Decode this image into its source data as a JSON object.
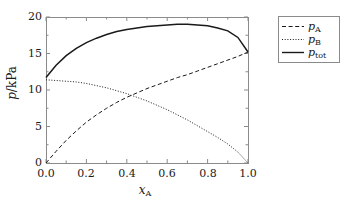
{
  "chart_data": {
    "type": "line",
    "title": "",
    "xlabel": "x_A",
    "ylabel": "p/kPa",
    "xlim": [
      0.0,
      1.0
    ],
    "ylim": [
      0.0,
      20.0
    ],
    "grid": false,
    "legend_position": "right-outside",
    "x_ticks": [
      "0.0",
      "0.2",
      "0.4",
      "0.6",
      "0.8",
      "1.0"
    ],
    "x_tick_values": [
      0.0,
      0.2,
      0.4,
      0.6,
      0.8,
      1.0
    ],
    "y_ticks": [
      "0",
      "5",
      "10",
      "15",
      "20"
    ],
    "y_tick_values": [
      0,
      5,
      10,
      15,
      20
    ],
    "x": [
      0.0,
      0.05,
      0.1,
      0.15,
      0.2,
      0.25,
      0.3,
      0.35,
      0.4,
      0.45,
      0.5,
      0.55,
      0.6,
      0.65,
      0.7,
      0.75,
      0.8,
      0.85,
      0.9,
      0.95,
      1.0
    ],
    "series": [
      {
        "name": "p_A",
        "label": "pA",
        "style": "dashed",
        "color": "#1a1a1a",
        "values": [
          0.0,
          1.6,
          3.1,
          4.4,
          5.6,
          6.6,
          7.5,
          8.3,
          9.0,
          9.6,
          10.2,
          10.7,
          11.2,
          11.7,
          12.1,
          12.6,
          13.1,
          13.6,
          14.1,
          14.6,
          15.2
        ]
      },
      {
        "name": "p_B",
        "label": "pB",
        "style": "dotted",
        "color": "#1a1a1a",
        "values": [
          11.4,
          11.3,
          11.2,
          11.1,
          10.9,
          10.6,
          10.3,
          9.9,
          9.5,
          9.0,
          8.5,
          7.9,
          7.3,
          6.6,
          5.9,
          5.1,
          4.3,
          3.5,
          2.6,
          1.5,
          0.0
        ]
      },
      {
        "name": "p_tot",
        "label": "ptot",
        "style": "solid",
        "color": "#1a1a1a",
        "values": [
          11.7,
          13.4,
          14.7,
          15.7,
          16.5,
          17.1,
          17.6,
          18.0,
          18.3,
          18.5,
          18.7,
          18.8,
          18.9,
          19.0,
          19.0,
          18.9,
          18.8,
          18.5,
          18.1,
          17.2,
          15.2
        ]
      }
    ],
    "legend": [
      {
        "label_main": "p",
        "label_sub": "A",
        "style": "dashed"
      },
      {
        "label_main": "p",
        "label_sub": "B",
        "style": "dotted"
      },
      {
        "label_main": "p",
        "label_sub": "tot",
        "style": "solid"
      }
    ],
    "axis_titles": {
      "y_main": "p",
      "y_unit": "/kPa",
      "x_main": "x",
      "x_sub": "A"
    },
    "colors": {
      "axis": "#8b8b8b",
      "curve": "#1a1a1a",
      "background": "#ffffff"
    }
  }
}
